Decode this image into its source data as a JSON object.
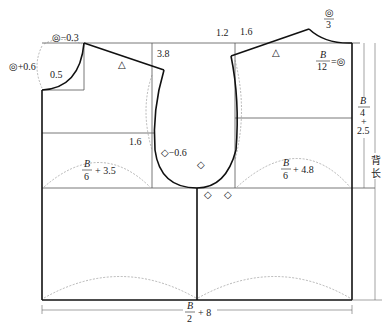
{
  "diagram": {
    "type": "garment-pattern-draft",
    "colors": {
      "line": "#111111",
      "thin": "#555555",
      "guide": "#888888",
      "background": "#ffffff"
    },
    "labels": {
      "back_neck_width": "◎−0.3",
      "back_neck_depth": "◎+0.6",
      "back_neck_curve": "0.5",
      "back_shoulder_drop": "3.8",
      "back_shoulder_length": "△",
      "back_armhole_point": "1.6",
      "back_armhole_diamond": "◇−0.6",
      "back_width": {
        "num": "B",
        "den": "6",
        "suffix": "+ 3.5"
      },
      "front_shoulder_drop_1": "1.2",
      "front_shoulder_drop_2": "1.6",
      "front_shoulder_length": "△",
      "front_neck_ratio": {
        "num": "◎",
        "den": "3"
      },
      "front_neck_width": {
        "num": "B",
        "den": "12",
        "suffix": "=◎"
      },
      "front_width": {
        "num": "B",
        "den": "6",
        "suffix": "+ 4.8"
      },
      "armhole_depth": {
        "num": "B",
        "den": "4",
        "suffix": "+",
        "suffix2": "2.5"
      },
      "back_length": "背长",
      "total_width": {
        "num": "B",
        "den": "2",
        "suffix": "+ 8"
      },
      "diamond_1": "◇",
      "diamond_2": "◇",
      "diamond_3": "◇"
    }
  }
}
